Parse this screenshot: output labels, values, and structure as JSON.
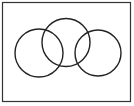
{
  "diagram": {
    "type": "venn-like-overlapping-circles",
    "frame": {
      "x": 2.5,
      "y": 2.5,
      "width": 128,
      "height": 99,
      "stroke": "#333333",
      "stroke_width": 1.2
    },
    "circles": [
      {
        "id": "left",
        "cx": 39,
        "cy": 53,
        "r": 24
      },
      {
        "id": "middle",
        "cx": 66,
        "cy": 42.5,
        "r": 24
      },
      {
        "id": "right",
        "cx": 98,
        "cy": 53,
        "r": 23
      }
    ],
    "circle_stroke": "#222222",
    "circle_stroke_width": 1.4,
    "background": "#ffffff",
    "labels": []
  }
}
